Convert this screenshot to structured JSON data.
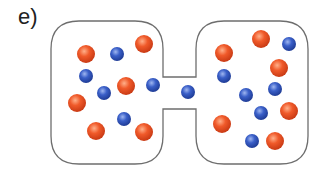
{
  "figure": {
    "label": "e)",
    "colors": {
      "outline": "#6e6e6e",
      "orange_particle": "#f05a2a",
      "orange_highlight": "#ffb08a",
      "orange_shadow": "#c93a14",
      "blue_particle": "#3a5fc8",
      "blue_highlight": "#9fb6f0",
      "blue_shadow": "#1f3c96"
    },
    "container": {
      "left_chamber": {
        "x": 51,
        "y": 21,
        "right": 163,
        "bottom": 164,
        "corner_radius": 28
      },
      "right_chamber": {
        "x": 196,
        "y": 21,
        "right": 308,
        "bottom": 164,
        "corner_radius": 28
      },
      "channel": {
        "x1": 163,
        "x2": 196,
        "y_top": 77,
        "y_bottom": 109
      }
    },
    "particles": {
      "orange_radius": 9,
      "blue_radius": 7,
      "orange": [
        {
          "x": 86,
          "y": 54
        },
        {
          "x": 144,
          "y": 44
        },
        {
          "x": 126,
          "y": 86
        },
        {
          "x": 77,
          "y": 103
        },
        {
          "x": 96,
          "y": 131
        },
        {
          "x": 144,
          "y": 132
        },
        {
          "x": 261,
          "y": 39
        },
        {
          "x": 224,
          "y": 53
        },
        {
          "x": 279,
          "y": 68
        },
        {
          "x": 289,
          "y": 111
        },
        {
          "x": 222,
          "y": 124
        },
        {
          "x": 275,
          "y": 141
        }
      ],
      "blue": [
        {
          "x": 117,
          "y": 54
        },
        {
          "x": 86,
          "y": 76
        },
        {
          "x": 153,
          "y": 85
        },
        {
          "x": 104,
          "y": 93
        },
        {
          "x": 124,
          "y": 119
        },
        {
          "x": 188,
          "y": 92
        },
        {
          "x": 289,
          "y": 44
        },
        {
          "x": 224,
          "y": 76
        },
        {
          "x": 275,
          "y": 89
        },
        {
          "x": 246,
          "y": 95
        },
        {
          "x": 261,
          "y": 113
        },
        {
          "x": 252,
          "y": 141
        }
      ]
    },
    "counts": {
      "left_chamber": {
        "orange": 6,
        "blue": 5
      },
      "channel": {
        "orange": 0,
        "blue": 1
      },
      "right_chamber": {
        "orange": 6,
        "blue": 6
      }
    }
  }
}
